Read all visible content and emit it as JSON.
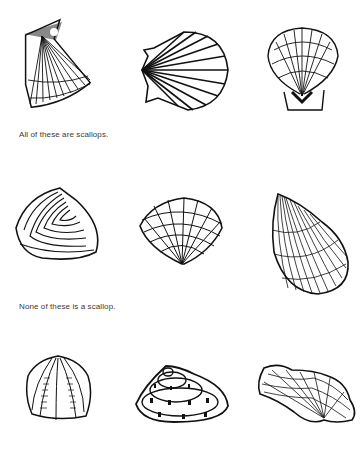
{
  "page": {
    "background": "#ffffff",
    "ink": "#111111"
  },
  "rows": [
    {
      "caption": "All of these are scallops.",
      "shells": [
        {
          "icon": "scallop-shell-tilted-icon"
        },
        {
          "icon": "scallop-shell-sideways-icon"
        },
        {
          "icon": "scallop-shell-upright-icon"
        }
      ]
    },
    {
      "caption": "None of these is a scallop.",
      "shells": [
        {
          "icon": "clam-shell-concentric-icon"
        },
        {
          "icon": "cockle-shell-grid-icon"
        },
        {
          "icon": "mussel-shell-ribbed-icon"
        }
      ]
    },
    {
      "caption": "",
      "shells": [
        {
          "icon": "ribbed-shell-icon"
        },
        {
          "icon": "limpet-shell-conical-icon"
        },
        {
          "icon": "wavy-net-shell-icon"
        }
      ]
    }
  ]
}
